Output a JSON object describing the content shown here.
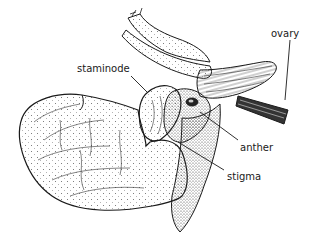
{
  "diagram": {
    "labels": {
      "ovary": "ovary",
      "staminode": "staminode",
      "anther": "anther",
      "stigma": "stigma"
    },
    "colors": {
      "ink": "#1a1a1a",
      "background": "#ffffff"
    }
  }
}
